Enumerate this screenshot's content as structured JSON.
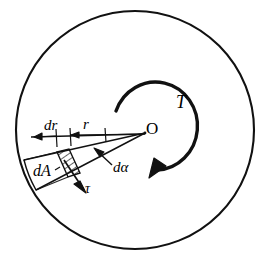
{
  "figure": {
    "colors": {
      "ink": "#111111",
      "background": "#ffffff"
    },
    "labels": {
      "dr": "dr",
      "r": "r",
      "dA": "dA",
      "d_alpha": "dα",
      "tau": "τ",
      "center": "O",
      "torque": "T"
    },
    "geometry": {
      "circle_center_x": 135,
      "circle_center_y": 130,
      "circle_radius": 119,
      "center_point_x": 145,
      "center_point_y": 133,
      "wedge_angle_deg": 13,
      "element_radius_inner": 96,
      "element_radius_outer": 108
    }
  }
}
